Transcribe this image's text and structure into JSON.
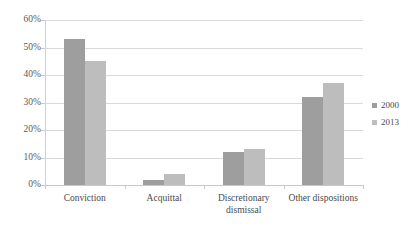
{
  "chart_data": {
    "type": "bar",
    "title": "",
    "subtitle": "",
    "xlabel": "",
    "ylabel": "",
    "categories": [
      "Conviction",
      "Acquittal",
      "Discretionary dismissal",
      "Other dispositions"
    ],
    "category_lines": [
      [
        "Conviction"
      ],
      [
        "Acquittal"
      ],
      [
        "Discretionary",
        "dismissal"
      ],
      [
        "Other dispositions"
      ]
    ],
    "series": [
      {
        "name": "2000",
        "color": "#9e9e9e",
        "values": [
          53,
          2,
          12,
          32
        ]
      },
      {
        "name": "2013",
        "color": "#bdbdbd",
        "values": [
          45,
          4,
          13,
          37
        ]
      }
    ],
    "ylim": [
      0,
      60
    ],
    "ytick_values": [
      0,
      10,
      20,
      30,
      40,
      50,
      60
    ],
    "ytick_labels": [
      "0%",
      "10%",
      "20%",
      "30%",
      "40%",
      "50%",
      "60%"
    ],
    "grid": true,
    "grid_color": "#d9d9d9",
    "legend_position": "right",
    "value_suffix": "%",
    "background_color": "#ffffff",
    "axis_color": "#c9c9c9",
    "text_color": "#4a4a4a"
  }
}
